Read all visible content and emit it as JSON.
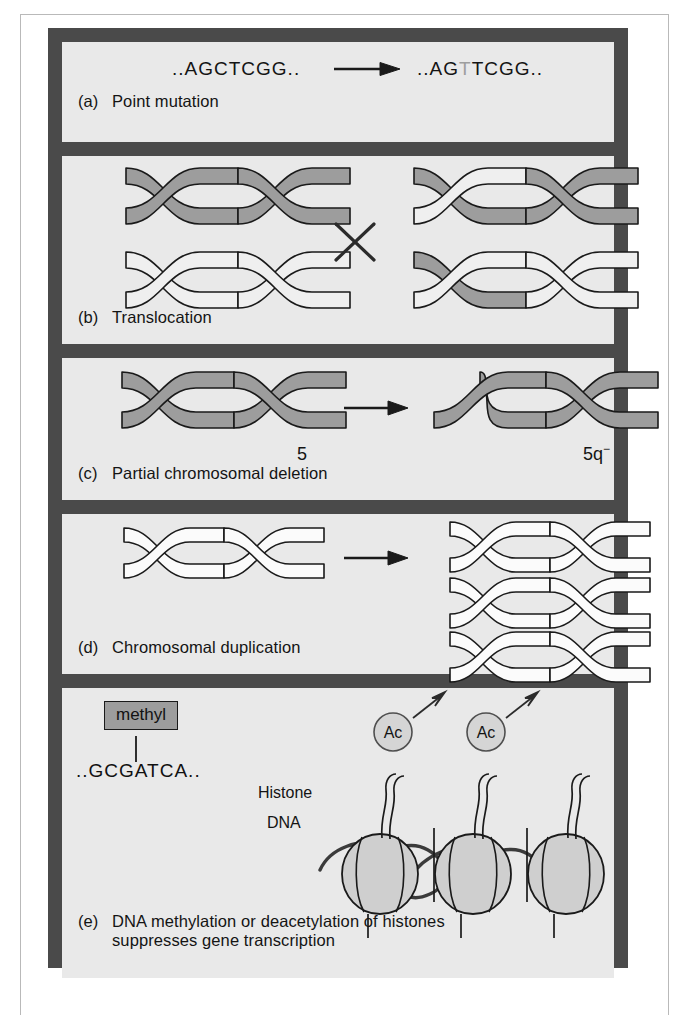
{
  "figure": {
    "panels": [
      {
        "id": "a",
        "tag": "(a)",
        "caption": "Point mutation",
        "sequence_before": "..AGCTCGG..",
        "sequence_after_prefix": "..AG",
        "sequence_after_mutated": "T",
        "sequence_after_suffix": "TCGG..",
        "arrow": "right-arrow"
      },
      {
        "id": "b",
        "tag": "(b)",
        "caption": "Translocation",
        "marker": "×",
        "chromosomes_before": [
          "dark",
          "white"
        ],
        "chromosomes_after": [
          "dark-with-white-arm",
          "white-with-dark-arm"
        ]
      },
      {
        "id": "c",
        "tag": "(c)",
        "caption": "Partial chromosomal deletion",
        "label_before": "5",
        "label_after": "5q",
        "label_after_sup": "−",
        "arrow": "right-arrow"
      },
      {
        "id": "d",
        "tag": "(d)",
        "caption": "Chromosomal duplication",
        "arrow": "right-arrow",
        "copies_before": 1,
        "copies_after": 3
      },
      {
        "id": "e",
        "tag": "(e)",
        "caption_line1": "DNA methylation or deacetylation of histones",
        "caption_line2": "suppresses gene transcription",
        "methyl_label": "methyl",
        "sequence": "..GCGATCA..",
        "label_histone": "Histone",
        "label_dna": "DNA",
        "acetyl_label": "Ac",
        "nucleosome_count": 3,
        "acetyl_count": 2
      }
    ]
  },
  "colors": {
    "frame": "#4a4a4a",
    "panel_background": "#e9e9e9",
    "chromosome_dark": "#9d9d9d",
    "chromosome_light": "#eeeeee",
    "outline": "#1a1a1a",
    "text": "#141414",
    "mutated_base": "#9e9e9e",
    "nucleosome_fill": "#cfcfcf",
    "page_rule": "#b9b9b9"
  }
}
